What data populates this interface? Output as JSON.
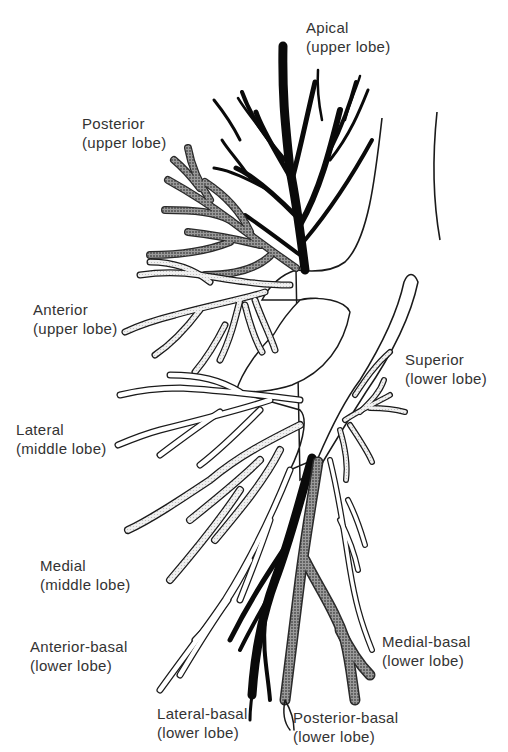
{
  "diagram": {
    "colors": {
      "apical": "#0a0a0a",
      "posterior_stipple": "#7a7a7a",
      "light_stipple": "#dcdcdc",
      "outline": "#1a1a1a",
      "background": "#ffffff",
      "label_text": "#333333"
    },
    "labels": [
      {
        "id": "apical",
        "name": "Apical",
        "lobe": "(upper lobe)",
        "x": 306,
        "y": 18
      },
      {
        "id": "posterior-upper",
        "name": "Posterior",
        "lobe": "(upper lobe)",
        "x": 82,
        "y": 114
      },
      {
        "id": "anterior-upper",
        "name": "Anterior",
        "lobe": "(upper lobe)",
        "x": 33,
        "y": 300
      },
      {
        "id": "superior-lower",
        "name": "Superior",
        "lobe": "(lower lobe)",
        "x": 405,
        "y": 350
      },
      {
        "id": "lateral-middle",
        "name": "Lateral",
        "lobe": "(middle lobe)",
        "x": 16,
        "y": 420
      },
      {
        "id": "medial-middle",
        "name": "Medial",
        "lobe": "(middle lobe)",
        "x": 40,
        "y": 556
      },
      {
        "id": "anterior-basal",
        "name": "Anterior-basal",
        "lobe": "(lower lobe)",
        "x": 30,
        "y": 637
      },
      {
        "id": "medial-basal",
        "name": "Medial-basal",
        "lobe": "(lower lobe)",
        "x": 382,
        "y": 632
      },
      {
        "id": "lateral-basal",
        "name": "Lateral-basal",
        "lobe": "(lower lobe)",
        "x": 157,
        "y": 704
      },
      {
        "id": "posterior-basal",
        "name": "Posterior-basal",
        "lobe": "(lower lobe)",
        "x": 293,
        "y": 708
      }
    ]
  }
}
